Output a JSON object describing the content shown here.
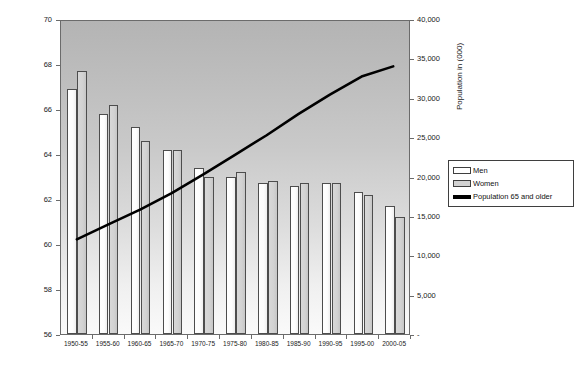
{
  "chart_data": {
    "type": "bar",
    "title": "",
    "xlabel": "",
    "ylabel": "Age",
    "y2label": "Population in (000)",
    "grid": false,
    "legend_position": "right",
    "categories": [
      "1950-55",
      "1955-60",
      "1960-65",
      "1965-70",
      "1970-75",
      "1975-80",
      "1980-85",
      "1985-90",
      "1990-95",
      "1995-00",
      "2000-05"
    ],
    "ylim": [
      56,
      70
    ],
    "yticks": [
      56,
      58,
      60,
      62,
      64,
      66,
      68,
      70
    ],
    "ytick_labels": [
      "56",
      "58",
      "60",
      "62",
      "64",
      "66",
      "68",
      "70"
    ],
    "y2lim": [
      0,
      40000
    ],
    "y2ticks": [
      0,
      5000,
      10000,
      15000,
      20000,
      25000,
      30000,
      35000,
      40000
    ],
    "y2tick_labels": [
      "-",
      "5,000",
      "10,000",
      "15,000",
      "20,000",
      "25,000",
      "30,000",
      "35,000",
      "40,000"
    ],
    "series": [
      {
        "name": "Men",
        "type": "bar",
        "axis": "left",
        "values": [
          66.9,
          65.8,
          65.2,
          64.2,
          63.4,
          63.0,
          62.7,
          62.6,
          62.7,
          62.3,
          61.7
        ]
      },
      {
        "name": "Women",
        "type": "bar",
        "axis": "left",
        "values": [
          67.7,
          66.2,
          64.6,
          64.2,
          63.0,
          63.2,
          62.8,
          62.7,
          62.7,
          62.2,
          61.2
        ]
      },
      {
        "name": "Population 65 and older",
        "type": "line",
        "axis": "right",
        "values": [
          12100,
          14000,
          15900,
          18000,
          20400,
          22900,
          25400,
          28100,
          30600,
          32900,
          34200
        ]
      }
    ]
  },
  "legend": {
    "items": [
      {
        "label": "Men",
        "marker": "bar-white"
      },
      {
        "label": "Women",
        "marker": "bar-gray"
      },
      {
        "label": "Population 65 and older",
        "marker": "line-black"
      }
    ]
  },
  "colors": {
    "men_bar": "#ffffff",
    "women_bar": "#d2d2d2",
    "line": "#000000",
    "plot_border": "#6b6b6b",
    "text": "#1a1a1a"
  }
}
